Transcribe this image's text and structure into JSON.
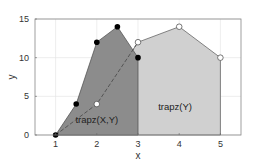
{
  "chart_data": {
    "type": "area",
    "title": "",
    "xlabel": "x",
    "ylabel": "y",
    "xlim": [
      0.5,
      5.5
    ],
    "ylim": [
      0,
      15
    ],
    "xticks": [
      1,
      2,
      3,
      4,
      5
    ],
    "yticks": [
      0,
      5,
      10,
      15
    ],
    "grid": true,
    "legend": null,
    "series": [
      {
        "name": "trapz(X,Y)",
        "x": [
          1,
          1.5,
          2,
          2.5,
          3
        ],
        "y": [
          0,
          4,
          12,
          14,
          10
        ],
        "marker": "filled-circle",
        "fill": "#8c8c8c"
      },
      {
        "name": "trapz(Y)",
        "x": [
          1,
          2,
          3,
          4,
          5
        ],
        "y": [
          0,
          4,
          12,
          14,
          10
        ],
        "marker": "open-circle",
        "fill": "#d0d0d0",
        "line_style": "dashed-between-1-and-3"
      }
    ],
    "annotations": [
      {
        "text": "trapz(X,Y)",
        "x": 2.0,
        "y": 1.5
      },
      {
        "text": "trapz(Y)",
        "x": 3.9,
        "y": 3.2
      }
    ]
  },
  "labels": {
    "xlabel": "x",
    "ylabel": "y",
    "xticks": [
      "1",
      "2",
      "3",
      "4",
      "5"
    ],
    "yticks": [
      "0",
      "5",
      "10",
      "15"
    ],
    "annot_xy": "trapz(X,Y)",
    "annot_y": "trapz(Y)"
  }
}
